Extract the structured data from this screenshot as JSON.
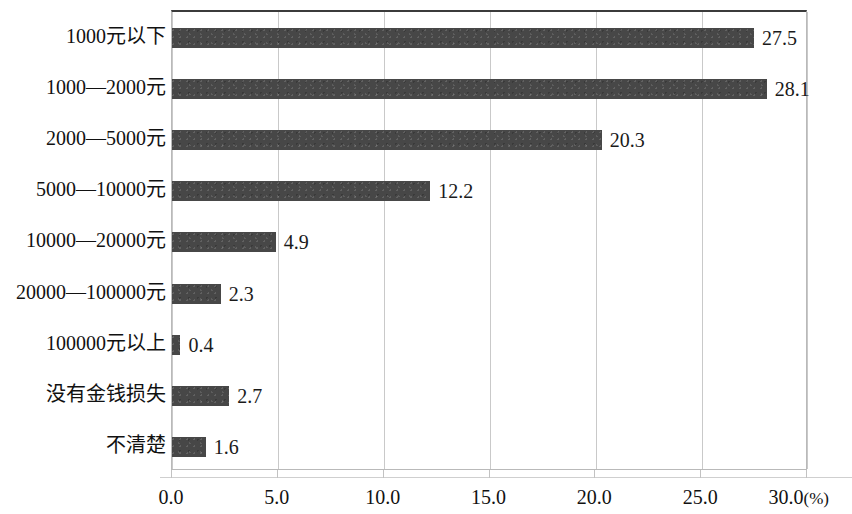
{
  "chart_data": {
    "type": "bar",
    "orientation": "horizontal",
    "title": "",
    "subtitle": "",
    "xlabel": "(%)",
    "ylabel": "",
    "categories": [
      "1000元以下",
      "1000—2000元",
      "2000—5000元",
      "5000—10000元",
      "10000—20000元",
      "20000—100000元",
      "100000元以上",
      "没有金钱损失",
      "不清楚"
    ],
    "values": [
      27.5,
      28.1,
      20.3,
      12.2,
      4.9,
      2.3,
      0.4,
      2.7,
      1.6
    ],
    "value_labels": [
      "27.5",
      "28.1",
      "20.3",
      "12.2",
      "4.9",
      "2.3",
      "0.4",
      "2.7",
      "1.6"
    ],
    "xlim": [
      0.0,
      30.0
    ],
    "xticks": [
      0.0,
      5.0,
      10.0,
      15.0,
      20.0,
      25.0,
      30.0
    ],
    "xtick_labels": [
      "0.0",
      "5.0",
      "10.0",
      "15.0",
      "20.0",
      "25.0",
      "30.0"
    ],
    "axis_unit": "(%)",
    "grid": true,
    "grid_axis": "x",
    "legend": false,
    "legend_position": "none",
    "bar_color": "#474747",
    "grid_color": "#c9c9c9",
    "frame_color": "#b9b9b9",
    "text_color": "#111111"
  }
}
